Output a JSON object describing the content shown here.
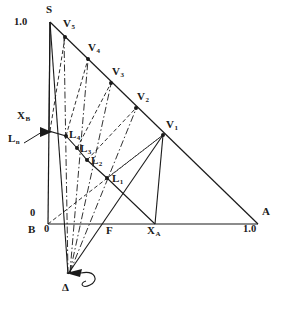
{
  "figure": {
    "type": "ternary-phase-diagram",
    "axis_labels": {
      "apex_value": "1.0",
      "origin_left_value": "0",
      "origin_bottom_value": "0",
      "right_value": "1.0"
    },
    "vertices": [
      {
        "name": "S",
        "label": "S",
        "x": 50,
        "y": 22,
        "label_x": 46,
        "label_y": 6
      },
      {
        "name": "B",
        "label": "B",
        "x": 48,
        "y": 224,
        "label_x": 29,
        "label_y": 226
      },
      {
        "name": "A",
        "label": "A",
        "x": 258,
        "y": 224,
        "label_x": 263,
        "label_y": 207
      }
    ],
    "vapour_points": [
      {
        "label": "V",
        "sub": "1",
        "x": 163,
        "y": 135,
        "label_x": 166,
        "label_y": 121
      },
      {
        "label": "V",
        "sub": "2",
        "x": 136,
        "y": 108,
        "label_x": 139,
        "label_y": 94
      },
      {
        "label": "V",
        "sub": "3",
        "x": 111,
        "y": 83,
        "label_x": 114,
        "label_y": 69
      },
      {
        "label": "V",
        "sub": "4",
        "x": 88,
        "y": 59,
        "label_x": 91,
        "label_y": 45
      },
      {
        "label": "V",
        "sub": "5",
        "x": 65,
        "y": 37,
        "label_x": 64,
        "label_y": 22
      }
    ],
    "liquid_points": [
      {
        "label": "L",
        "sub": "1",
        "x": 107,
        "y": 178,
        "label_x": 112,
        "label_y": 176
      },
      {
        "label": "L",
        "sub": "2",
        "x": 87,
        "y": 160,
        "label_x": 92,
        "label_y": 158
      },
      {
        "label": "L",
        "sub": "3",
        "x": 77,
        "y": 148,
        "label_x": 82,
        "label_y": 145
      },
      {
        "label": "L",
        "sub": "4",
        "x": 66,
        "y": 136,
        "label_x": 70,
        "label_y": 131
      }
    ],
    "feed_point": {
      "label": "X",
      "sub": "B",
      "marker_x": 49,
      "marker_y": 131,
      "label_x": 18,
      "label_y": 112
    },
    "reflux_label": {
      "label": "L",
      "sub": "n",
      "label_x": 9,
      "label_y": 133
    },
    "base_marks": [
      {
        "label": "F",
        "sub": "",
        "label_x": 106,
        "label_y": 226
      },
      {
        "label": "X",
        "sub": "A",
        "label_x": 147,
        "label_y": 226
      }
    ],
    "delta_pole": {
      "label": "Δ",
      "x": 68,
      "y": 274,
      "label_x": 64,
      "label_y": 283
    },
    "tick_values": {
      "left_top": "1.0",
      "left_bottom": "0",
      "base_left": "0",
      "base_right": "1.0"
    },
    "tick_positions": {
      "left_top_x": 16,
      "left_top_y": 18,
      "left_bottom_x": 31,
      "left_bottom_y": 209,
      "base_left_x": 44,
      "base_left_y": 226,
      "base_right_x": 247,
      "base_right_y": 226
    },
    "colors": {
      "stroke": "#1a1a1a",
      "background": "#ffffff"
    }
  }
}
